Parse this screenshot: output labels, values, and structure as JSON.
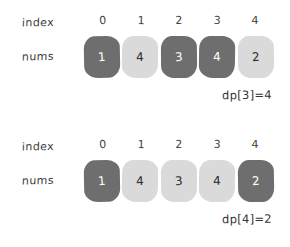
{
  "figure": {
    "style": "hand-drawn",
    "background_color": "#ffffff",
    "dark_box_color": "#6e6e6e",
    "light_box_color": "#dadada",
    "dark_box_text_color": "#ffffff",
    "light_box_text_color": "#2e2e2e"
  },
  "panels": [
    {
      "index_label": "index",
      "nums_label": "nums",
      "indices": [
        "0",
        "1",
        "2",
        "3",
        "4"
      ],
      "values": [
        "1",
        "4",
        "3",
        "4",
        "2"
      ],
      "highlight": [
        "dark",
        "light",
        "dark",
        "dark",
        "light"
      ],
      "annotation": "dp[3]=4"
    },
    {
      "index_label": "index",
      "nums_label": "nums",
      "indices": [
        "0",
        "1",
        "2",
        "3",
        "4"
      ],
      "values": [
        "1",
        "4",
        "3",
        "4",
        "2"
      ],
      "highlight": [
        "dark",
        "light",
        "light",
        "light",
        "dark"
      ],
      "annotation": "dp[4]=2"
    }
  ]
}
